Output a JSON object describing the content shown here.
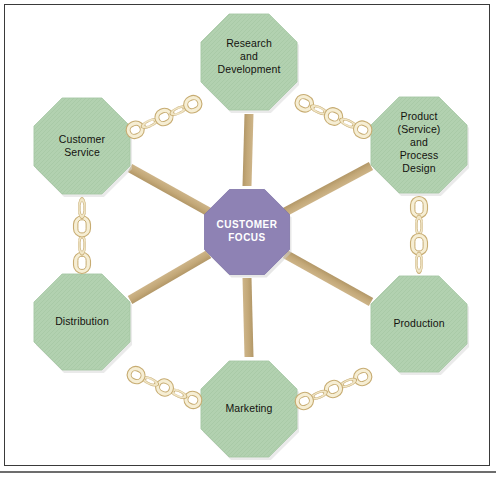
{
  "figure": {
    "type": "hub-and-spoke-diagram",
    "background_color": "#ffffff",
    "border_color": "#3a3a3a"
  },
  "center": {
    "label": "CUSTOMER\nFOCUS",
    "shape": "octagon",
    "fill": "#8e82b4",
    "text_color": "#ffffff",
    "cx": 247,
    "cy": 232,
    "radius": 46
  },
  "palette": {
    "node_fill": "#b2d1b0",
    "node_fill_dark": "#a3c6a2",
    "spoke": "#c4a97a",
    "chain_fill": "#f6eed4",
    "chain_stroke": "#c7ac72"
  },
  "nodes": [
    {
      "id": "research-and-development",
      "label": "Research\nand\nDevelopment",
      "cx": 249,
      "cy": 62,
      "radius": 52,
      "label_width": 104,
      "label_top": 37
    },
    {
      "id": "product-service-and-process-design",
      "label": "Product\n(Service)\nand\nProcess\nDesign",
      "cx": 419,
      "cy": 145,
      "radius": 52,
      "label_width": 96,
      "label_top": 110
    },
    {
      "id": "production",
      "label": "Production",
      "cx": 419,
      "cy": 324,
      "radius": 52,
      "label_width": 100,
      "label_top": 317
    },
    {
      "id": "marketing",
      "label": "Marketing",
      "cx": 249,
      "cy": 409,
      "radius": 52,
      "label_width": 100,
      "label_top": 402
    },
    {
      "id": "distribution",
      "label": "Distribution",
      "cx": 82,
      "cy": 322,
      "radius": 52,
      "label_width": 100,
      "label_top": 315
    },
    {
      "id": "customer-service",
      "label": "Customer\nService",
      "cx": 82,
      "cy": 146,
      "radius": 52,
      "label_width": 96,
      "label_top": 133
    }
  ],
  "spokes": [
    {
      "id": "spoke-research-and-development",
      "x1": 249,
      "y1": 114,
      "x2": 247,
      "y2": 186
    },
    {
      "id": "spoke-product-service-and-process-design",
      "x1": 371,
      "y1": 166,
      "x2": 285,
      "y2": 212
    },
    {
      "id": "spoke-production",
      "x1": 371,
      "y1": 302,
      "x2": 285,
      "y2": 254
    },
    {
      "id": "spoke-marketing",
      "x1": 249,
      "y1": 357,
      "x2": 247,
      "y2": 278
    },
    {
      "id": "spoke-distribution",
      "x1": 130,
      "y1": 300,
      "x2": 209,
      "y2": 254
    },
    {
      "id": "spoke-customer-service",
      "x1": 130,
      "y1": 168,
      "x2": 209,
      "y2": 212
    }
  ],
  "chains": [
    {
      "id": "chain-customer-service-to-research",
      "x1": 128,
      "y1": 133,
      "x2": 200,
      "y2": 101,
      "links": 5
    },
    {
      "id": "chain-research-to-product-design",
      "x1": 297,
      "y1": 100,
      "x2": 370,
      "y2": 133,
      "links": 5
    },
    {
      "id": "chain-product-design-to-production",
      "x1": 419,
      "y1": 198,
      "x2": 419,
      "y2": 272,
      "links": 4
    },
    {
      "id": "chain-production-to-marketing",
      "x1": 370,
      "y1": 374,
      "x2": 297,
      "y2": 404,
      "links": 5
    },
    {
      "id": "chain-marketing-to-distribution",
      "x1": 200,
      "y1": 403,
      "x2": 129,
      "y2": 372,
      "links": 5
    },
    {
      "id": "chain-distribution-to-customer-service",
      "x1": 82,
      "y1": 272,
      "x2": 82,
      "y2": 199,
      "links": 4
    }
  ]
}
